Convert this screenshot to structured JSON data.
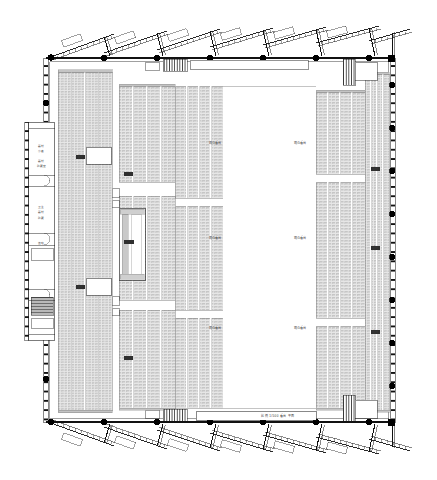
{
  "drawing": {
    "type": "architectural-floor-plan",
    "subject": "stadium-seating-plan",
    "background_color": "#ffffff",
    "line_color": "#1a1a1a",
    "seat_fill_color": "#d4d4d4",
    "seat_line_color": "#8c8c8c",
    "column_marker_color": "#000000",
    "label_color": "#3a3a3a",
    "canvas": {
      "width": 437,
      "height": 480
    }
  },
  "field": {
    "name": "central-field",
    "zone_labels": [
      "观众看台",
      "观众看台",
      "观众看台",
      "观众看台",
      "观众看台",
      "观众看台"
    ]
  },
  "seating": {
    "left_outer_label": "看台",
    "left_inner_label": "看台",
    "right_inner_label": "看台",
    "right_outer_label": "看台",
    "right_outer_label_2": "看台",
    "right_outer_label_3": "看台"
  },
  "rooms": {
    "items": [
      {
        "label_line_1": "器材",
        "label_line_2": "小卖"
      },
      {
        "label_line_1": "器材",
        "label_line_2": "贮藏室"
      },
      {
        "label_line_1": "卫生",
        "label_line_2": "器材",
        "label_line_3": "贮藏"
      },
      {
        "label_line_1": "值班"
      }
    ]
  },
  "annotations": {
    "bottom_strip": "比例  1/500  看台  平面"
  },
  "structure": {
    "top_canopy_count": 7,
    "bottom_canopy_count": 7,
    "top_column_count": 7,
    "bottom_column_count": 7,
    "left_wall_tick_count": 44,
    "right_wall_tick_count": 44,
    "left_column_count": 7,
    "right_column_count": 8
  }
}
